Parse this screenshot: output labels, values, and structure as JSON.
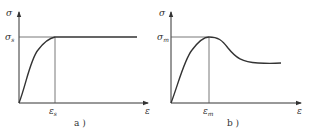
{
  "figures": [
    {
      "id": "a",
      "caption": "a )",
      "y_axis_label": "σ",
      "x_axis_label": "ε",
      "y_level_label": "σ",
      "y_level_sub": "s",
      "x_level_label": "ε",
      "x_level_sub": "s",
      "description": "Elastic-perfectly plastic: stress rises to yield σs at εs, then stays constant"
    },
    {
      "id": "b",
      "caption": "b )",
      "y_axis_label": "σ",
      "x_axis_label": "ε",
      "y_level_label": "σ",
      "y_level_sub": "m",
      "x_level_label": "ε",
      "x_level_sub": "m",
      "description": "Stress rises to peak σm at εm, then softens and levels off at a lower residual stress"
    }
  ],
  "colors": {
    "line": "#333333",
    "guide": "#555555"
  }
}
